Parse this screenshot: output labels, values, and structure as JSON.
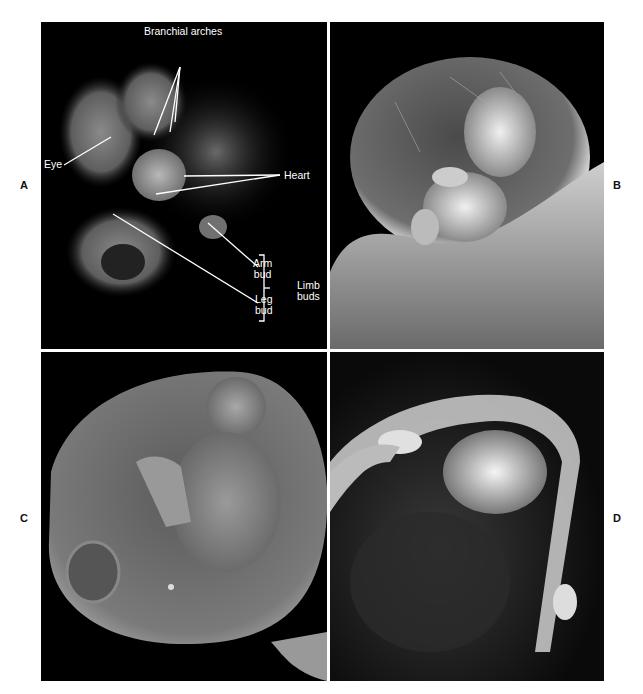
{
  "figure": {
    "panels": [
      {
        "id": "A",
        "label": "A",
        "description": "Early embryo with labeled structures"
      },
      {
        "id": "B",
        "label": "B",
        "description": "Embryo within amniotic sac above chorionic villi"
      },
      {
        "id": "C",
        "label": "C",
        "description": "Fetus within amniotic sac"
      },
      {
        "id": "D",
        "label": "D",
        "description": "Later fetus with hands visible"
      }
    ],
    "annotations": {
      "branchial_arches": "Branchial arches",
      "eye": "Eye",
      "heart": "Heart",
      "arm_bud_line1": "Arm",
      "arm_bud_line2": "bud",
      "leg_bud_line1": "Leg",
      "leg_bud_line2": "bud",
      "limb_buds_line1": "Limb",
      "limb_buds_line2": "buds"
    }
  }
}
